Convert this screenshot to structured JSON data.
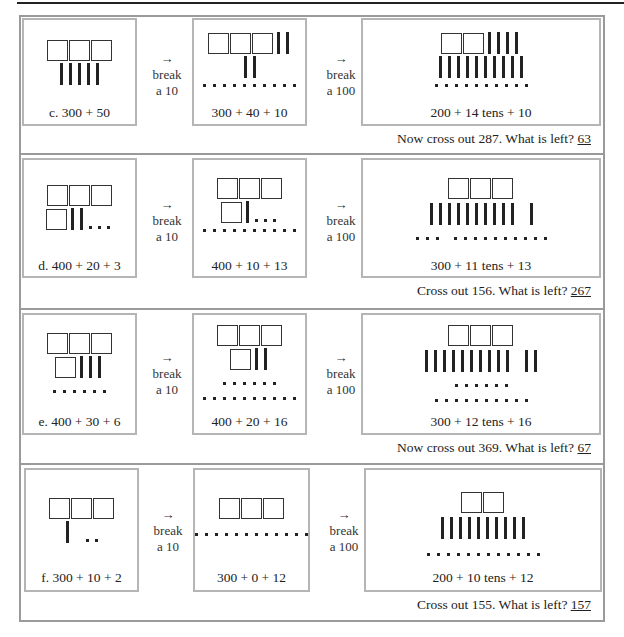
{
  "rows": [
    {
      "id": "c",
      "box1": {
        "caption": "c. 300 + 50"
      },
      "arrow1": {
        "symbol": "→",
        "line1": "break",
        "line2": "a 10"
      },
      "box2": {
        "caption": "300 + 40 + 10"
      },
      "arrow2": {
        "symbol": "→",
        "line1": "break",
        "line2": "a 100"
      },
      "box3": {
        "caption": "200 + 14 tens + 10"
      },
      "question": "Now cross out 287. What is left?",
      "answer": "63"
    },
    {
      "id": "d",
      "box1": {
        "caption": "d. 400 + 20 + 3"
      },
      "arrow1": {
        "symbol": "→",
        "line1": "break",
        "line2": "a 10"
      },
      "box2": {
        "caption": "400 + 10 + 13"
      },
      "arrow2": {
        "symbol": "→",
        "line1": "break",
        "line2": "a 100"
      },
      "box3": {
        "caption": "300 +  11 tens + 13"
      },
      "question": "Cross out 156. What is left?",
      "answer": "267"
    },
    {
      "id": "e",
      "box1": {
        "caption": "e.  400 + 30 + 6"
      },
      "arrow1": {
        "symbol": "→",
        "line1": "break",
        "line2": "a 10"
      },
      "box2": {
        "caption": "400 + 20 + 16"
      },
      "arrow2": {
        "symbol": "→",
        "line1": "break",
        "line2": "a 100"
      },
      "box3": {
        "caption": "300 + 12 tens + 16"
      },
      "question": "Now cross out 369. What is left?",
      "answer": "67"
    },
    {
      "id": "f",
      "box1": {
        "caption": "f. 300 + 10 + 2"
      },
      "arrow1": {
        "symbol": "→",
        "line1": "break",
        "line2": "a 10"
      },
      "box2": {
        "caption": "300 + 0 + 12"
      },
      "arrow2": {
        "symbol": "→",
        "line1": "break",
        "line2": "a 100"
      },
      "box3": {
        "caption": "200 + 10 tens + 12"
      },
      "question": "Cross out 155. What is left?",
      "answer": "157"
    }
  ]
}
